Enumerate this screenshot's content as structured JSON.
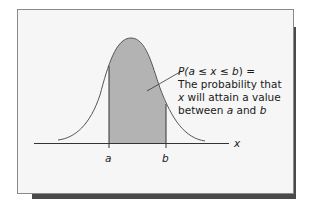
{
  "figure": {
    "annotation": {
      "line1_prefix": "P(",
      "line1_var_a": "a",
      "line1_le1": " ≤ ",
      "line1_var_x": "x",
      "line1_le2": " ≤ ",
      "line1_var_b": "b",
      "line1_suffix": ") =",
      "line2": "The probability that",
      "line3_var": "x",
      "line3_rest": " will attain a value",
      "line4_prefix": "between ",
      "line4_var_a": "a",
      "line4_mid": " and ",
      "line4_var_b": "b"
    },
    "axis_label": "x",
    "tick_a": "a",
    "tick_b": "b",
    "colors": {
      "shade": "#b3b3b3",
      "curve": "#555555",
      "axis": "#333333",
      "panel": "#f6f6f6",
      "shadow": "#4a4a4a"
    }
  }
}
